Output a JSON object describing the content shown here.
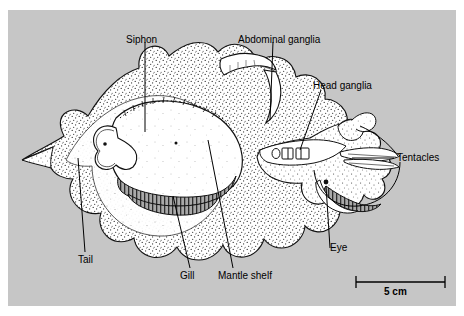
{
  "figure": {
    "top_caption": "",
    "background_color": "#c6c6c6",
    "ink_color": "#000000",
    "body_fill": "#ffffff"
  },
  "labels": [
    {
      "id": "siphon",
      "text": "Siphon",
      "x": 118,
      "y": 30,
      "align": "left"
    },
    {
      "id": "abdominal-ganglia",
      "text": "Abdominal ganglia",
      "x": 238,
      "y": 30,
      "align": "left"
    },
    {
      "id": "head-ganglia",
      "text": "Head ganglia",
      "x": 313,
      "y": 78,
      "align": "left"
    },
    {
      "id": "tentacles",
      "text": "Tentacles",
      "x": 395,
      "y": 148,
      "align": "left"
    },
    {
      "id": "eye",
      "text": "Eye",
      "x": 330,
      "y": 240,
      "align": "left"
    },
    {
      "id": "tail",
      "text": "Tail",
      "x": 78,
      "y": 250,
      "align": "left"
    },
    {
      "id": "gill",
      "text": "Gill",
      "x": 178,
      "y": 265,
      "align": "left"
    },
    {
      "id": "mantle-shelf",
      "text": "Mantle shelf",
      "x": 218,
      "y": 265,
      "align": "left"
    }
  ],
  "scale_bar": {
    "label": "5 cm",
    "label_x": 383,
    "label_y": 288,
    "line_y": 283,
    "x_start": 348,
    "x_end": 437
  }
}
